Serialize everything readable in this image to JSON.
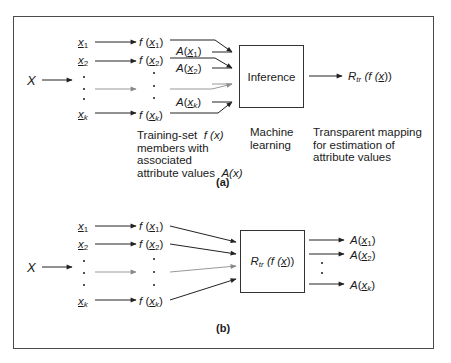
{
  "diagram": {
    "part_a": {
      "label": "(a)",
      "input": "X",
      "members": [
        {
          "x": "x",
          "sub": "1",
          "f": "f",
          "attr": "A"
        },
        {
          "x": "x",
          "sub": "2",
          "f": "f",
          "attr": "A"
        },
        {
          "x": "x",
          "sub": "k",
          "f": "f",
          "attr": "A"
        }
      ],
      "box_label": "Inference",
      "output": {
        "R": "R",
        "sub": "tr",
        "expr_open": "(f (",
        "x": "x",
        "expr_close": "))"
      },
      "captions": {
        "training_line1": "Training-set",
        "training_fx": "f (x)",
        "training_line2": "members with",
        "training_line3": "associated",
        "training_line4": "attribute values",
        "training_ax": "A(x)",
        "ml_line1": "Machine",
        "ml_line2": "learning",
        "tm_line1": "Transparent mapping",
        "tm_line2": "for  estimation of",
        "tm_line3": "attribute values"
      }
    },
    "part_b": {
      "label": "(b)",
      "input": "X",
      "members": [
        {
          "x": "x",
          "sub": "1",
          "f": "f",
          "attr": "A"
        },
        {
          "x": "x",
          "sub": "2",
          "f": "f",
          "attr": "A"
        },
        {
          "x": "x",
          "sub": "k",
          "f": "f",
          "attr": "A"
        }
      ],
      "box": {
        "R": "R",
        "sub": "tr",
        "expr_open": "(f (",
        "x": "x",
        "expr_close": "))"
      }
    }
  }
}
